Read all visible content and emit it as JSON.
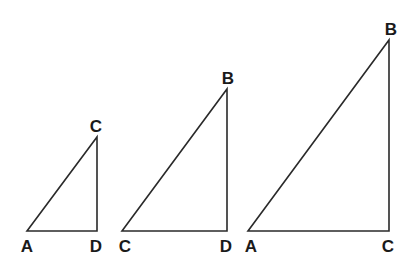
{
  "diagram": {
    "triangles": [
      {
        "id": "small",
        "vertices": {
          "A": {
            "x": 27,
            "y": 231
          },
          "D": {
            "x": 97,
            "y": 231
          },
          "C": {
            "x": 97,
            "y": 137
          }
        },
        "labels": [
          {
            "text": "C",
            "x": 96,
            "y": 132
          },
          {
            "text": "A",
            "x": 27,
            "y": 252
          },
          {
            "text": "D",
            "x": 96,
            "y": 252
          }
        ],
        "right_angle_at": "D"
      },
      {
        "id": "medium",
        "vertices": {
          "C": {
            "x": 122,
            "y": 231
          },
          "D": {
            "x": 227,
            "y": 231
          },
          "B": {
            "x": 227,
            "y": 89
          }
        },
        "labels": [
          {
            "text": "B",
            "x": 228,
            "y": 84
          },
          {
            "text": "C",
            "x": 125,
            "y": 252
          },
          {
            "text": "D",
            "x": 226,
            "y": 252
          }
        ],
        "right_angle_at": "D"
      },
      {
        "id": "large",
        "vertices": {
          "A": {
            "x": 248,
            "y": 231
          },
          "C": {
            "x": 389,
            "y": 231
          },
          "B": {
            "x": 389,
            "y": 40
          }
        },
        "labels": [
          {
            "text": "B",
            "x": 391,
            "y": 35
          },
          {
            "text": "A",
            "x": 251,
            "y": 252
          },
          {
            "text": "C",
            "x": 388,
            "y": 252
          }
        ],
        "right_angle_at": "C"
      }
    ],
    "colors": {
      "stroke": "#2a2a2a",
      "label": "#1a1a1a",
      "background": "#ffffff"
    }
  }
}
